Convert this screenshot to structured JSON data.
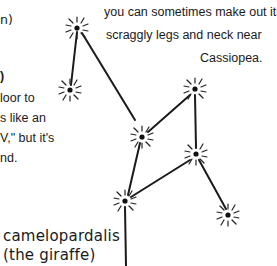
{
  "left_text": {
    "line0": "n)",
    "line1": ")",
    "line2": "loor to",
    "line3": "s like an",
    "line4": "V,\" but it's",
    "line5": "nd."
  },
  "caption": {
    "line1": "you can sometimes make out its",
    "line2": "scraggly legs and neck near",
    "line3": "Cassiopea."
  },
  "label": {
    "name": "camelopardalis",
    "common": "(the giraffe)"
  },
  "constellation": {
    "stars": [
      {
        "x": 77,
        "y": 28
      },
      {
        "x": 70,
        "y": 90
      },
      {
        "x": 142,
        "y": 137
      },
      {
        "x": 195,
        "y": 89
      },
      {
        "x": 196,
        "y": 154
      },
      {
        "x": 125,
        "y": 201
      },
      {
        "x": 228,
        "y": 215
      }
    ]
  }
}
